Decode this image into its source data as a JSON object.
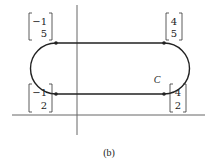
{
  "figure": {
    "caption": "(b)",
    "curve_label": "C",
    "points": [
      {
        "id": "top-left",
        "top": "−1",
        "bottom": "5"
      },
      {
        "id": "top-right",
        "top": "4",
        "bottom": "5"
      },
      {
        "id": "bottom-left",
        "top": "−1",
        "bottom": "2"
      },
      {
        "id": "bottom-right",
        "top": "4",
        "bottom": "2"
      }
    ],
    "colors": {
      "curve": "#222222",
      "axes": "#555555"
    }
  }
}
